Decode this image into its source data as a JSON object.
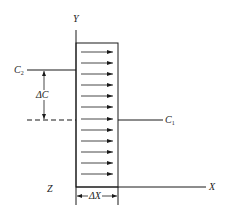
{
  "diagram": {
    "type": "diffusion-flux-slab",
    "labels": {
      "y_axis": "Y",
      "x_axis": "X",
      "z_axis": "Z",
      "c2_base": "C",
      "c2_sub": "2",
      "c1_base": "C",
      "c1_sub": "1",
      "delta_c": "ΔC",
      "delta_x": "ΔX"
    },
    "slab": {
      "arrow_count": 12,
      "arrow_direction": "right"
    },
    "colors": {
      "stroke": "#1a1a1a",
      "background": "#ffffff",
      "text": "#222222"
    }
  }
}
